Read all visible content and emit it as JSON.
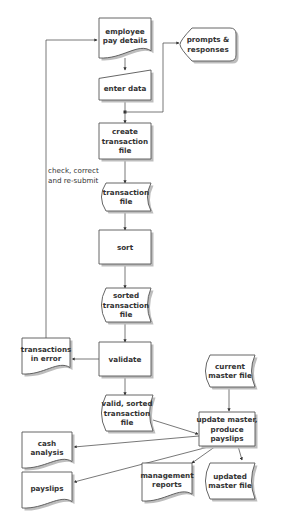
{
  "diagram": {
    "type": "system flowchart",
    "title": "",
    "nodes": [
      {
        "id": "employee_pay_details",
        "shape": "document",
        "lines": [
          "employee",
          "pay details"
        ]
      },
      {
        "id": "prompts_responses",
        "shape": "display",
        "lines": [
          "prompts &",
          "responses"
        ]
      },
      {
        "id": "enter_data",
        "shape": "manual-input",
        "lines": [
          "enter data"
        ]
      },
      {
        "id": "create_transaction_file",
        "shape": "process",
        "lines": [
          "create",
          "transaction",
          "file"
        ]
      },
      {
        "id": "transaction_file",
        "shape": "stored-data",
        "lines": [
          "transaction",
          "file"
        ]
      },
      {
        "id": "sort",
        "shape": "process",
        "lines": [
          "sort"
        ]
      },
      {
        "id": "sorted_transaction_file",
        "shape": "stored-data",
        "lines": [
          "sorted",
          "transaction",
          "file"
        ]
      },
      {
        "id": "validate",
        "shape": "process",
        "lines": [
          "validate"
        ]
      },
      {
        "id": "transactions_in_error",
        "shape": "document",
        "lines": [
          "transactions",
          "in error"
        ]
      },
      {
        "id": "valid_sorted_transaction_file",
        "shape": "stored-data",
        "lines": [
          "valid, sorted",
          "transaction",
          "file"
        ]
      },
      {
        "id": "current_master_file",
        "shape": "stored-data",
        "lines": [
          "current",
          "master file"
        ]
      },
      {
        "id": "update_master",
        "shape": "process",
        "lines": [
          "update master,",
          "produce",
          "payslips"
        ]
      },
      {
        "id": "cash_analysis",
        "shape": "document",
        "lines": [
          "cash",
          "analysis"
        ]
      },
      {
        "id": "payslips",
        "shape": "document",
        "lines": [
          "payslips"
        ]
      },
      {
        "id": "management_reports",
        "shape": "document",
        "lines": [
          "management",
          "reports"
        ]
      },
      {
        "id": "updated_master_file",
        "shape": "stored-data",
        "lines": [
          "updated",
          "master file"
        ]
      }
    ],
    "edges": [
      {
        "from": "employee_pay_details",
        "to": "enter_data"
      },
      {
        "from": "enter_data",
        "to": "prompts_responses"
      },
      {
        "from": "enter_data",
        "to": "create_transaction_file"
      },
      {
        "from": "create_transaction_file",
        "to": "transaction_file"
      },
      {
        "from": "transaction_file",
        "to": "sort"
      },
      {
        "from": "sort",
        "to": "sorted_transaction_file"
      },
      {
        "from": "sorted_transaction_file",
        "to": "validate"
      },
      {
        "from": "validate",
        "to": "transactions_in_error"
      },
      {
        "from": "validate",
        "to": "valid_sorted_transaction_file"
      },
      {
        "from": "transactions_in_error",
        "to": "employee_pay_details",
        "label": "check, correct and re-submit"
      },
      {
        "from": "valid_sorted_transaction_file",
        "to": "update_master"
      },
      {
        "from": "current_master_file",
        "to": "update_master"
      },
      {
        "from": "update_master",
        "to": "cash_analysis"
      },
      {
        "from": "update_master",
        "to": "payslips"
      },
      {
        "from": "update_master",
        "to": "management_reports"
      },
      {
        "from": "update_master",
        "to": "updated_master_file"
      }
    ],
    "annotations": {
      "resubmit_line1": "check, correct",
      "resubmit_line2": "and re-submit"
    }
  }
}
